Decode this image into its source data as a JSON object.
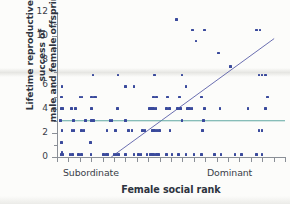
{
  "figure": {
    "background_color": "#fcfcfa",
    "marker_color": "#3a4a9c",
    "regression_line_color": "#5a5fa8",
    "reference_line_color": "#4e9e96",
    "axis_color": "#8a8f96"
  },
  "chart_data": {
    "type": "scatter",
    "title": "",
    "xlabel": "Female social rank",
    "ylabel": "Lifetime reproductive success of male and female offspring",
    "ylabel_line1": "Lifetime reproductive success of",
    "ylabel_line2": "male and female offspring",
    "xlim": [
      0,
      21
    ],
    "ylim": [
      0,
      12
    ],
    "yticks": [
      0,
      2,
      4,
      6,
      8,
      10,
      12
    ],
    "ytick_labels": [
      "0",
      "2",
      "4",
      "6",
      "8",
      "10",
      "12"
    ],
    "y_minor_ticks": [
      1,
      3,
      5,
      7,
      9,
      11
    ],
    "x_tick_count": 21,
    "x_tick_labels": [],
    "x_category_labels": [
      {
        "label": "Subordinate",
        "position": "left"
      },
      {
        "label": "Dominant",
        "position": "right"
      }
    ],
    "grid": false,
    "legend": false,
    "legend_position": "none",
    "marker": "square",
    "marker_size": 2.6,
    "annotations": [],
    "lines": [
      {
        "name": "regression-line",
        "style": "solid",
        "color": "#5a5fa8",
        "x": [
          5.0,
          20.0
        ],
        "y": [
          0.0,
          9.8
        ]
      },
      {
        "name": "reference-line",
        "style": "solid",
        "color": "#4e9e96",
        "x": [
          0.2,
          21.0
        ],
        "y": [
          3.0,
          3.0
        ]
      }
    ],
    "points": [
      [
        0.35,
        0.2
      ],
      [
        0.55,
        0.2
      ],
      [
        0.45,
        0.35
      ],
      [
        0.4,
        1.2
      ],
      [
        1.2,
        0.2
      ],
      [
        1.45,
        0.2
      ],
      [
        2.0,
        0.2
      ],
      [
        2.25,
        0.2
      ],
      [
        3.1,
        1.2
      ],
      [
        3.15,
        0.2
      ],
      [
        4.3,
        0.2
      ],
      [
        4.55,
        0.2
      ],
      [
        4.7,
        0.2
      ],
      [
        5.25,
        0.2
      ],
      [
        5.45,
        0.2
      ],
      [
        5.65,
        0.2
      ],
      [
        6.3,
        0.2
      ],
      [
        7.1,
        0.2
      ],
      [
        7.5,
        0.2
      ],
      [
        7.75,
        0.2
      ],
      [
        8.3,
        0.2
      ],
      [
        8.55,
        0.2
      ],
      [
        8.7,
        0.2
      ],
      [
        8.85,
        0.2
      ],
      [
        8.95,
        0.2
      ],
      [
        9.15,
        0.2
      ],
      [
        9.35,
        0.2
      ],
      [
        10.1,
        0.2
      ],
      [
        10.6,
        0.2
      ],
      [
        11.2,
        0.2
      ],
      [
        11.9,
        0.2
      ],
      [
        12.6,
        0.2
      ],
      [
        13.3,
        0.2
      ],
      [
        14.5,
        0.2
      ],
      [
        15.1,
        0.2
      ],
      [
        16.4,
        0.2
      ],
      [
        17.0,
        0.2
      ],
      [
        18.4,
        0.2
      ],
      [
        18.9,
        0.2
      ],
      [
        0.45,
        2.2
      ],
      [
        1.4,
        2.2
      ],
      [
        1.55,
        2.2
      ],
      [
        2.25,
        2.2
      ],
      [
        2.5,
        2.2
      ],
      [
        4.6,
        2.2
      ],
      [
        5.4,
        2.2
      ],
      [
        6.6,
        2.2
      ],
      [
        6.9,
        2.2
      ],
      [
        7.9,
        2.2
      ],
      [
        8.1,
        2.2
      ],
      [
        8.8,
        2.2
      ],
      [
        9.0,
        2.2
      ],
      [
        9.2,
        2.2
      ],
      [
        9.45,
        2.2
      ],
      [
        10.4,
        2.2
      ],
      [
        13.4,
        2.2
      ],
      [
        18.6,
        2.2
      ],
      [
        18.9,
        2.2
      ],
      [
        0.3,
        3.0
      ],
      [
        1.5,
        3.0
      ],
      [
        2.6,
        3.0
      ],
      [
        3.2,
        3.0
      ],
      [
        3.35,
        3.0
      ],
      [
        4.9,
        3.0
      ],
      [
        5.05,
        3.0
      ],
      [
        6.3,
        3.0
      ],
      [
        11.5,
        3.0
      ],
      [
        13.5,
        3.0
      ],
      [
        0.4,
        4.0
      ],
      [
        0.55,
        4.0
      ],
      [
        1.35,
        4.0
      ],
      [
        1.7,
        4.0
      ],
      [
        3.2,
        4.0
      ],
      [
        5.55,
        4.0
      ],
      [
        8.5,
        4.0
      ],
      [
        8.7,
        4.0
      ],
      [
        8.9,
        4.0
      ],
      [
        9.1,
        4.0
      ],
      [
        10.1,
        4.0
      ],
      [
        10.35,
        4.0
      ],
      [
        11.1,
        4.0
      ],
      [
        11.35,
        4.0
      ],
      [
        12.0,
        4.0
      ],
      [
        12.2,
        4.0
      ],
      [
        12.45,
        4.0
      ],
      [
        13.6,
        4.0
      ],
      [
        15.0,
        4.0
      ],
      [
        17.6,
        4.0
      ],
      [
        19.2,
        4.0
      ],
      [
        0.4,
        4.95
      ],
      [
        2.1,
        4.95
      ],
      [
        2.3,
        4.95
      ],
      [
        3.2,
        4.95
      ],
      [
        3.4,
        4.95
      ],
      [
        3.55,
        4.95
      ],
      [
        8.9,
        4.95
      ],
      [
        9.15,
        4.95
      ],
      [
        10.2,
        4.95
      ],
      [
        11.3,
        4.95
      ],
      [
        13.3,
        4.95
      ],
      [
        19.4,
        4.95
      ],
      [
        0.45,
        5.85
      ],
      [
        6.3,
        5.85
      ],
      [
        7.1,
        5.85
      ],
      [
        11.9,
        5.85
      ],
      [
        3.3,
        6.8
      ],
      [
        5.6,
        6.8
      ],
      [
        9.0,
        6.8
      ],
      [
        11.5,
        6.8
      ],
      [
        18.6,
        6.8
      ],
      [
        18.9,
        6.8
      ],
      [
        19.2,
        6.8
      ],
      [
        16.0,
        7.5
      ],
      [
        14.9,
        8.6
      ],
      [
        12.8,
        9.6
      ],
      [
        12.5,
        10.5
      ],
      [
        13.6,
        10.5
      ],
      [
        18.4,
        10.5
      ],
      [
        18.7,
        10.5
      ],
      [
        11.0,
        11.4
      ]
    ]
  }
}
